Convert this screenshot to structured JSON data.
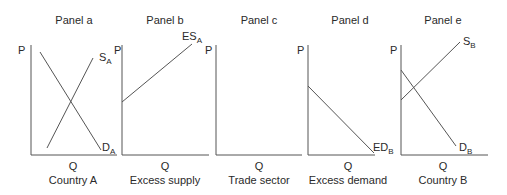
{
  "panels": [
    {
      "title": "Panel a",
      "xlabel": "Q",
      "ylabel": "P",
      "caption": "Country A",
      "curves": [
        {
          "name": "S",
          "sub": "A"
        },
        {
          "name": "D",
          "sub": "A"
        }
      ]
    },
    {
      "title": "Panel b",
      "xlabel": "Q",
      "ylabel": "P",
      "caption": "Excess supply",
      "curves": [
        {
          "name": "ES",
          "sub": "A"
        }
      ]
    },
    {
      "title": "Panel c",
      "xlabel": "Q",
      "ylabel": "P",
      "caption": "Trade sector",
      "curves": []
    },
    {
      "title": "Panel d",
      "xlabel": "Q",
      "ylabel": "P",
      "caption": "Excess demand",
      "curves": [
        {
          "name": "ED",
          "sub": "B"
        }
      ]
    },
    {
      "title": "Panel e",
      "xlabel": "Q",
      "ylabel": "P",
      "caption": "Country B",
      "curves": [
        {
          "name": "S",
          "sub": "B"
        },
        {
          "name": "D",
          "sub": "B"
        }
      ]
    }
  ],
  "colors": {
    "line": "#4a4a4a",
    "text": "#2a2a2a"
  }
}
